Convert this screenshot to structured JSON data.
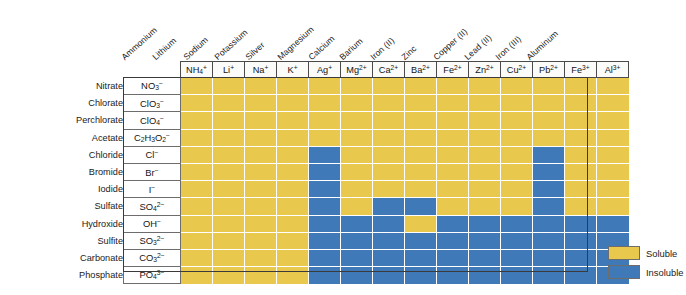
{
  "legend": {
    "soluble_label": "Soluble",
    "insoluble_label": "Insoluble"
  },
  "colors": {
    "soluble": "#e9c84e",
    "insoluble": "#3f79b8",
    "grid_line": "#ffffff",
    "frame": "#3a3a3a",
    "text": "#1b1b1b"
  },
  "cations": [
    {
      "name": "Ammonium",
      "symbol_base": "NH",
      "symbol_sub": "4",
      "symbol_sup": "+"
    },
    {
      "name": "Lithium",
      "symbol_base": "Li",
      "symbol_sub": "",
      "symbol_sup": "+"
    },
    {
      "name": "Sodium",
      "symbol_base": "Na",
      "symbol_sub": "",
      "symbol_sup": "+"
    },
    {
      "name": "Potassium",
      "symbol_base": "K",
      "symbol_sub": "",
      "symbol_sup": "+"
    },
    {
      "name": "Silver",
      "symbol_base": "Ag",
      "symbol_sub": "",
      "symbol_sup": "+"
    },
    {
      "name": "Magnesium",
      "symbol_base": "Mg",
      "symbol_sub": "",
      "symbol_sup": "2+"
    },
    {
      "name": "Calcium",
      "symbol_base": "Ca",
      "symbol_sub": "",
      "symbol_sup": "2+"
    },
    {
      "name": "Barium",
      "symbol_base": "Ba",
      "symbol_sub": "",
      "symbol_sup": "2+"
    },
    {
      "name": "Iron (II)",
      "symbol_base": "Fe",
      "symbol_sub": "",
      "symbol_sup": "2+"
    },
    {
      "name": "Zinc",
      "symbol_base": "Zn",
      "symbol_sub": "",
      "symbol_sup": "2+"
    },
    {
      "name": "Copper (II)",
      "symbol_base": "Cu",
      "symbol_sub": "",
      "symbol_sup": "2+"
    },
    {
      "name": "Lead (II)",
      "symbol_base": "Pb",
      "symbol_sub": "",
      "symbol_sup": "2+"
    },
    {
      "name": "Iron (III)",
      "symbol_base": "Fe",
      "symbol_sub": "",
      "symbol_sup": "3+"
    },
    {
      "name": "Aluminum",
      "symbol_base": "Al",
      "symbol_sub": "",
      "symbol_sup": "3+"
    }
  ],
  "anions": [
    {
      "name": "Nitrate",
      "formula_html": "NO<sub>3</sub><sup>−</sup>"
    },
    {
      "name": "Chlorate",
      "formula_html": "ClO<sub>3</sub><sup>−</sup>"
    },
    {
      "name": "Perchlorate",
      "formula_html": "ClO<sub>4</sub><sup>−</sup>"
    },
    {
      "name": "Acetate",
      "formula_html": "C<sub>2</sub>H<sub>3</sub>O<sub>2</sub><sup>−</sup>"
    },
    {
      "name": "Chloride",
      "formula_html": "Cl<sup>−</sup>"
    },
    {
      "name": "Bromide",
      "formula_html": "Br<sup>−</sup>"
    },
    {
      "name": "Iodide",
      "formula_html": "I<sup>−</sup>"
    },
    {
      "name": "Sulfate",
      "formula_html": "SO<sub>4</sub><sup>2−</sup>"
    },
    {
      "name": "Hydroxide",
      "formula_html": "OH<sup>−</sup>"
    },
    {
      "name": "Sulfite",
      "formula_html": "SO<sub>3</sub><sup>2−</sup>"
    },
    {
      "name": "Carbonate",
      "formula_html": "CO<sub>3</sub><sup>2−</sup>"
    },
    {
      "name": "Phosphate",
      "formula_html": "PO<sub>4</sub><sup>3−</sup>"
    }
  ],
  "chart_data": {
    "type": "heatmap",
    "xlabel": "Cation",
    "ylabel": "Anion",
    "legend_position": "bottom-right",
    "value_legend": {
      "S": "Soluble",
      "I": "Insoluble"
    },
    "x_categories": [
      "NH4+",
      "Li+",
      "Na+",
      "K+",
      "Ag+",
      "Mg2+",
      "Ca2+",
      "Ba2+",
      "Fe2+",
      "Zn2+",
      "Cu2+",
      "Pb2+",
      "Fe3+",
      "Al3+"
    ],
    "x_category_names": [
      "Ammonium",
      "Lithium",
      "Sodium",
      "Potassium",
      "Silver",
      "Magnesium",
      "Calcium",
      "Barium",
      "Iron (II)",
      "Zinc",
      "Copper (II)",
      "Lead (II)",
      "Iron (III)",
      "Aluminum"
    ],
    "y_categories": [
      "NO3-",
      "ClO3-",
      "ClO4-",
      "C2H3O2-",
      "Cl-",
      "Br-",
      "I-",
      "SO42-",
      "OH-",
      "SO32-",
      "CO32-",
      "PO43-"
    ],
    "y_category_names": [
      "Nitrate",
      "Chlorate",
      "Perchlorate",
      "Acetate",
      "Chloride",
      "Bromide",
      "Iodide",
      "Sulfate",
      "Hydroxide",
      "Sulfite",
      "Carbonate",
      "Phosphate"
    ],
    "matrix": [
      [
        "S",
        "S",
        "S",
        "S",
        "S",
        "S",
        "S",
        "S",
        "S",
        "S",
        "S",
        "S",
        "S",
        "S"
      ],
      [
        "S",
        "S",
        "S",
        "S",
        "S",
        "S",
        "S",
        "S",
        "S",
        "S",
        "S",
        "S",
        "S",
        "S"
      ],
      [
        "S",
        "S",
        "S",
        "S",
        "S",
        "S",
        "S",
        "S",
        "S",
        "S",
        "S",
        "S",
        "S",
        "S"
      ],
      [
        "S",
        "S",
        "S",
        "S",
        "S",
        "S",
        "S",
        "S",
        "S",
        "S",
        "S",
        "S",
        "S",
        "S"
      ],
      [
        "S",
        "S",
        "S",
        "S",
        "I",
        "S",
        "S",
        "S",
        "S",
        "S",
        "S",
        "I",
        "S",
        "S"
      ],
      [
        "S",
        "S",
        "S",
        "S",
        "I",
        "S",
        "S",
        "S",
        "S",
        "S",
        "S",
        "I",
        "S",
        "S"
      ],
      [
        "S",
        "S",
        "S",
        "S",
        "I",
        "S",
        "S",
        "S",
        "S",
        "S",
        "S",
        "I",
        "S",
        "S"
      ],
      [
        "S",
        "S",
        "S",
        "S",
        "I",
        "S",
        "I",
        "I",
        "S",
        "S",
        "S",
        "I",
        "S",
        "S"
      ],
      [
        "S",
        "S",
        "S",
        "S",
        "I",
        "I",
        "I",
        "S",
        "I",
        "I",
        "I",
        "I",
        "I",
        "I"
      ],
      [
        "S",
        "S",
        "S",
        "S",
        "I",
        "I",
        "I",
        "I",
        "I",
        "I",
        "I",
        "I",
        "I",
        "I"
      ],
      [
        "S",
        "S",
        "S",
        "S",
        "I",
        "I",
        "I",
        "I",
        "I",
        "I",
        "I",
        "I",
        "I",
        "I"
      ],
      [
        "S",
        "S",
        "S",
        "S",
        "I",
        "I",
        "I",
        "I",
        "I",
        "I",
        "I",
        "I",
        "I",
        "I"
      ]
    ]
  }
}
